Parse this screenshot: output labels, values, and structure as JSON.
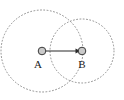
{
  "diagram": {
    "background_color": "#ffffff",
    "width": 124,
    "height": 100,
    "circles": [
      {
        "id": "circle-a",
        "name": "left-dotted-circle",
        "cx": 42,
        "cy": 51,
        "r": 41,
        "stroke_color": "#8d8d8d",
        "style": "dotted"
      },
      {
        "id": "circle-b",
        "name": "right-dotted-circle",
        "cx": 82,
        "cy": 51,
        "r": 32,
        "stroke_color": "#8d8d8d",
        "style": "dotted"
      }
    ],
    "points": [
      {
        "id": "point-a",
        "label": "A",
        "cx": 42,
        "cy": 51,
        "r": 4,
        "fill_color": "#c9c9c9",
        "stroke_color": "#3a3a3a",
        "label_x": 38,
        "label_y": 68
      },
      {
        "id": "point-b",
        "label": "B",
        "cx": 82,
        "cy": 51,
        "r": 4,
        "fill_color": "#c9c9c9",
        "stroke_color": "#3a3a3a",
        "label_x": 82,
        "label_y": 68
      }
    ],
    "arrow": {
      "id": "arrow-a-to-b",
      "from": "A",
      "to": "B",
      "x1": 42,
      "y1": 51,
      "x2": 79,
      "y2": 51,
      "color": "#2a2a2a",
      "head": "triangle"
    }
  }
}
